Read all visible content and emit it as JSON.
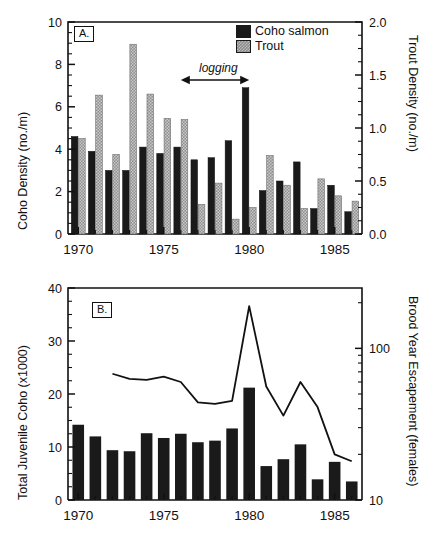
{
  "figure": {
    "background": "#ffffff",
    "coho_color": "#1a1a1a",
    "trout_color": "#8c8c8c",
    "line_color": "#111111"
  },
  "panel_a": {
    "tag": "A.",
    "left_axis_title": "Coho Density  (no./m)",
    "right_axis_title": "Trout Density  (no./m)",
    "legend": {
      "coho_label": "Coho salmon",
      "trout_label": "Trout"
    },
    "annotation": {
      "label": "logging",
      "start_year": 1976,
      "end_year": 1980
    },
    "left_ticks": [
      "0",
      "2",
      "4",
      "6",
      "8",
      "10"
    ],
    "right_ticks": [
      "0.0",
      "0.5",
      "1.0",
      "1.5",
      "2.0"
    ],
    "x_ticks": [
      "1970",
      "1975",
      "1980",
      "1985"
    ]
  },
  "panel_b": {
    "tag": "B.",
    "left_axis_title": "Total Juvenile Coho (x1000)",
    "right_axis_title": "Brood Year Escapement  (females)",
    "left_ticks": [
      "0",
      "10",
      "20",
      "30",
      "40"
    ],
    "right_ticks": [
      "10",
      "100"
    ],
    "x_ticks": [
      "1970",
      "1975",
      "1980",
      "1985"
    ]
  },
  "chart_data": [
    {
      "type": "bar",
      "title": "A.",
      "xlabel": "",
      "ylabel": "Coho Density  (no./m)",
      "y2label": "Trout Density  (no./m)",
      "ylim": [
        0,
        10
      ],
      "y2lim": [
        0,
        2.0
      ],
      "xlim": [
        1969.4,
        1986.6
      ],
      "grid": false,
      "legend_position": "top-right",
      "categories": [
        1970,
        1971,
        1972,
        1973,
        1974,
        1975,
        1976,
        1977,
        1978,
        1979,
        1980,
        1981,
        1982,
        1983,
        1984,
        1985,
        1986
      ],
      "series": [
        {
          "name": "Coho salmon",
          "axis": "left",
          "color": "#1a1a1a",
          "values": [
            4.6,
            3.9,
            3.0,
            3.0,
            4.1,
            3.8,
            4.1,
            3.5,
            3.6,
            4.4,
            6.9,
            2.05,
            2.5,
            3.4,
            1.2,
            2.3,
            1.05
          ]
        },
        {
          "name": "Trout",
          "axis": "right",
          "color": "#8c8c8c",
          "values": [
            0.9,
            1.31,
            0.75,
            1.79,
            1.32,
            1.09,
            1.08,
            0.28,
            0.48,
            0.14,
            0.25,
            0.74,
            0.46,
            0.24,
            0.52,
            0.36,
            0.31
          ]
        }
      ],
      "annotations": [
        {
          "text": "logging",
          "x_start": 1976,
          "x_end": 1980,
          "style": "double-arrow"
        }
      ]
    },
    {
      "type": "bar",
      "title": "B.",
      "xlabel": "",
      "ylabel": "Total Juvenile Coho (x1000)",
      "y2label": "Brood Year Escapement  (females)",
      "ylim": [
        0,
        40
      ],
      "y2lim": [
        10,
        250
      ],
      "y2scale": "log",
      "xlim": [
        1969.4,
        1986.6
      ],
      "grid": false,
      "categories": [
        1970,
        1971,
        1972,
        1973,
        1974,
        1975,
        1976,
        1977,
        1978,
        1979,
        1980,
        1981,
        1982,
        1983,
        1984,
        1985,
        1986
      ],
      "series": [
        {
          "name": "Total Juvenile Coho",
          "type": "bar",
          "axis": "left",
          "color": "#1a1a1a",
          "values": [
            14.2,
            12.0,
            9.4,
            9.2,
            12.6,
            11.7,
            12.5,
            10.9,
            11.2,
            13.5,
            21.2,
            6.4,
            7.7,
            10.5,
            3.9,
            7.2,
            3.5
          ]
        },
        {
          "name": "Brood Year Escapement",
          "type": "line",
          "axis": "right",
          "color": "#111111",
          "x": [
            1972,
            1973,
            1974,
            1975,
            1976,
            1977,
            1978,
            1979,
            1980,
            1981,
            1982,
            1983,
            1984,
            1985,
            1986
          ],
          "values": [
            68,
            63,
            62,
            65,
            60,
            44,
            43,
            45,
            190,
            56,
            36,
            60,
            41,
            20,
            18
          ]
        }
      ]
    }
  ]
}
